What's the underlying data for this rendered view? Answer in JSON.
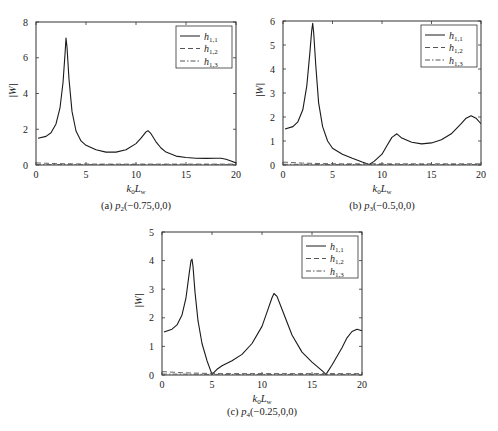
{
  "chart_data": [
    {
      "id": "a",
      "type": "line",
      "caption": "(a) p2(−0.75,0,0)",
      "caption_prefix": "(a) ",
      "caption_var": "p",
      "caption_sub": "2",
      "caption_args": "(−0.75,0,0)",
      "xlabel": "k0Lw",
      "ylabel": "|W|",
      "xlim": [
        0,
        20
      ],
      "ylim": [
        0,
        8
      ],
      "xticks": [
        0,
        5,
        10,
        15,
        20
      ],
      "yticks": [
        0,
        2,
        4,
        6,
        8
      ],
      "box": {
        "x0": 36,
        "y0": 22,
        "x1": 236,
        "y1": 165
      },
      "legend": {
        "position": "upper right",
        "entries": [
          "h1,1",
          "h1,2",
          "h1,3"
        ]
      },
      "series": [
        {
          "name": "h1,1",
          "style": "solid",
          "x": [
            0.2,
            1,
            1.5,
            2,
            2.4,
            2.7,
            2.9,
            3.0,
            3.1,
            3.3,
            3.6,
            4,
            4.5,
            5,
            6,
            7,
            8,
            9,
            10,
            10.5,
            11,
            11.2,
            11.5,
            12,
            12.5,
            13,
            14,
            15,
            16,
            17,
            18,
            18.5,
            19,
            19.5,
            20
          ],
          "y": [
            1.5,
            1.6,
            1.8,
            2.3,
            3.2,
            4.6,
            6.2,
            7.1,
            6.6,
            4.8,
            3.0,
            1.9,
            1.35,
            1.1,
            0.85,
            0.72,
            0.72,
            0.85,
            1.2,
            1.5,
            1.85,
            1.92,
            1.75,
            1.3,
            0.95,
            0.72,
            0.5,
            0.42,
            0.38,
            0.37,
            0.38,
            0.38,
            0.32,
            0.22,
            0.12
          ]
        },
        {
          "name": "h1,2",
          "style": "dashed",
          "x": [
            0,
            2,
            4,
            6,
            8,
            10,
            12,
            14,
            16,
            18,
            20
          ],
          "y": [
            0.12,
            0.08,
            0.06,
            0.05,
            0.05,
            0.05,
            0.05,
            0.05,
            0.05,
            0.05,
            0.05
          ]
        },
        {
          "name": "h1,3",
          "style": "dashdot",
          "x": [
            0,
            2,
            4,
            6,
            8,
            10,
            12,
            14,
            16,
            18,
            20
          ],
          "y": [
            0.03,
            0.03,
            0.02,
            0.02,
            0.02,
            0.02,
            0.02,
            0.02,
            0.02,
            0.02,
            0.02
          ]
        }
      ]
    },
    {
      "id": "b",
      "type": "line",
      "caption": "(b) p3(−0.5,0,0)",
      "caption_prefix": "(b) ",
      "caption_var": "p",
      "caption_sub": "3",
      "caption_args": "(−0.5,0,0)",
      "xlabel": "k0Lw",
      "ylabel": "|W|",
      "xlim": [
        0,
        20
      ],
      "ylim": [
        0,
        6
      ],
      "xticks": [
        0,
        5,
        10,
        15,
        20
      ],
      "yticks": [
        0,
        1,
        2,
        3,
        4,
        5,
        6
      ],
      "box": {
        "x0": 283,
        "y0": 21,
        "x1": 481,
        "y1": 165
      },
      "legend": {
        "position": "upper right",
        "entries": [
          "h1,1",
          "h1,2",
          "h1,3"
        ]
      },
      "series": [
        {
          "name": "h1,1",
          "style": "solid",
          "x": [
            0.2,
            1,
            1.5,
            2,
            2.4,
            2.7,
            2.9,
            3.0,
            3.1,
            3.3,
            3.6,
            4,
            4.5,
            5,
            6,
            7,
            8,
            8.7,
            9.2,
            10,
            10.5,
            11,
            11.5,
            12,
            13,
            14,
            15,
            16,
            17,
            18,
            18.5,
            19,
            19.5,
            20
          ],
          "y": [
            1.5,
            1.6,
            1.8,
            2.3,
            3.3,
            4.6,
            5.6,
            5.9,
            5.5,
            4.2,
            2.6,
            1.6,
            1.0,
            0.7,
            0.45,
            0.28,
            0.12,
            0.02,
            0.15,
            0.45,
            0.8,
            1.15,
            1.3,
            1.12,
            0.95,
            0.88,
            0.92,
            1.05,
            1.3,
            1.72,
            1.95,
            2.05,
            1.95,
            1.72
          ]
        },
        {
          "name": "h1,2",
          "style": "dashed",
          "x": [
            0,
            2,
            4,
            6,
            8,
            10,
            12,
            14,
            16,
            18,
            20
          ],
          "y": [
            0.12,
            0.08,
            0.06,
            0.05,
            0.05,
            0.05,
            0.05,
            0.05,
            0.05,
            0.05,
            0.05
          ]
        },
        {
          "name": "h1,3",
          "style": "dashdot",
          "x": [
            0,
            2,
            4,
            6,
            8,
            10,
            12,
            14,
            16,
            18,
            20
          ],
          "y": [
            0.03,
            0.03,
            0.02,
            0.02,
            0.02,
            0.02,
            0.02,
            0.02,
            0.02,
            0.02,
            0.02
          ]
        }
      ]
    },
    {
      "id": "c",
      "type": "line",
      "caption": "(c) p4(−0.25,0,0)",
      "caption_prefix": "(c) ",
      "caption_var": "p",
      "caption_sub": "4",
      "caption_args": "(−0.25,0,0)",
      "xlabel": "k0Lw",
      "ylabel": "|W|",
      "xlim": [
        0,
        20
      ],
      "ylim": [
        0,
        5
      ],
      "xticks": [
        0,
        5,
        10,
        15,
        20
      ],
      "yticks": [
        0,
        1,
        2,
        3,
        4,
        5
      ],
      "box": {
        "x0": 162,
        "y0": 232,
        "x1": 362,
        "y1": 375
      },
      "legend": {
        "position": "upper right",
        "entries": [
          "h1,1",
          "h1,2",
          "h1,3"
        ]
      },
      "series": [
        {
          "name": "h1,1",
          "style": "solid",
          "x": [
            0.2,
            1,
            1.5,
            2,
            2.4,
            2.7,
            2.9,
            3.0,
            3.1,
            3.3,
            3.6,
            4,
            4.5,
            5.0,
            5.5,
            6,
            7,
            8,
            9,
            10,
            10.5,
            11,
            11.2,
            11.5,
            12,
            13,
            14,
            15,
            16,
            16.4,
            17,
            18,
            18.5,
            19,
            19.5,
            20
          ],
          "y": [
            1.5,
            1.6,
            1.75,
            2.1,
            2.7,
            3.5,
            4.0,
            4.05,
            3.8,
            2.9,
            1.9,
            1.1,
            0.5,
            0.02,
            0.2,
            0.32,
            0.5,
            0.72,
            1.1,
            1.7,
            2.2,
            2.7,
            2.85,
            2.75,
            2.3,
            1.4,
            0.8,
            0.45,
            0.15,
            0.02,
            0.35,
            0.95,
            1.3,
            1.52,
            1.6,
            1.55
          ]
        },
        {
          "name": "h1,2",
          "style": "dashed",
          "x": [
            0,
            2,
            4,
            6,
            8,
            10,
            12,
            14,
            16,
            18,
            20
          ],
          "y": [
            0.12,
            0.08,
            0.06,
            0.05,
            0.05,
            0.05,
            0.05,
            0.05,
            0.05,
            0.05,
            0.05
          ]
        },
        {
          "name": "h1,3",
          "style": "dashdot",
          "x": [
            0,
            2,
            4,
            6,
            8,
            10,
            12,
            14,
            16,
            18,
            20
          ],
          "y": [
            0.03,
            0.03,
            0.02,
            0.02,
            0.02,
            0.02,
            0.02,
            0.02,
            0.02,
            0.02,
            0.02
          ]
        }
      ]
    }
  ],
  "legend_labels": [
    {
      "var": "h",
      "sub": "1,1",
      "style": "solid"
    },
    {
      "var": "h",
      "sub": "1,2",
      "style": "dashed"
    },
    {
      "var": "h",
      "sub": "1,3",
      "style": "dashdot"
    }
  ],
  "axis_labels": {
    "x_var": "k",
    "x_sub": "0",
    "x_var2": "L",
    "x_sub2": "w",
    "y": "|W|"
  },
  "colors": {
    "line": "#1a1a1a",
    "axis": "#333333",
    "dashed": "#555555"
  }
}
